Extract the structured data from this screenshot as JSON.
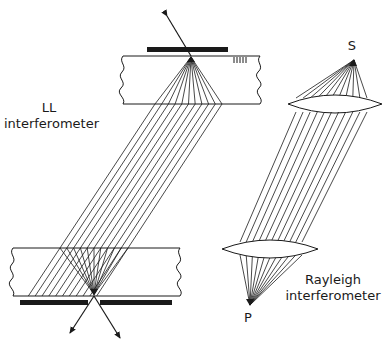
{
  "diagram": {
    "labels": {
      "ll_title_line1": "LL",
      "ll_title_line2": "interferometer",
      "rayleigh_line1": "Rayleigh",
      "rayleigh_line2": "interferometer",
      "source": "S",
      "point": "P"
    },
    "colors": {
      "ink": "#1a1a1a",
      "background": "#ffffff"
    },
    "ll_interferometer": {
      "top_slab": {
        "x1": 123,
        "x2": 260,
        "y_top": 56,
        "y_bottom": 104
      },
      "top_bar": {
        "x1": 147,
        "x2": 228,
        "y1": 47,
        "y2": 52
      },
      "top_focus": [
        191,
        57
      ],
      "incoming_arrow": {
        "from": [
          167,
          16
        ],
        "to": [
          191,
          56
        ]
      },
      "top_fan_bottom_x": [
        155,
        222
      ],
      "bottom_slab": {
        "x1": 13,
        "x2": 180,
        "y_top": 248,
        "y_bottom": 296
      },
      "bottom_bar": {
        "x1": 20,
        "x2": 172,
        "gap": [
          88,
          100
        ],
        "y1": 300,
        "y2": 305
      },
      "bottom_focus": [
        94,
        294
      ],
      "bottom_entry_x": [
        60,
        128
      ],
      "outgoing_arrows": [
        {
          "from": [
            94,
            294
          ],
          "to": [
            70,
            333
          ]
        },
        {
          "from": [
            94,
            294
          ],
          "to": [
            120,
            338
          ]
        }
      ],
      "ray_count": 11
    },
    "rayleigh_interferometer": {
      "source_point": [
        354,
        60
      ],
      "upper_lens": {
        "x1": 288,
        "x2": 382,
        "cy": 104,
        "half_thickness": 9
      },
      "upper_exit_x": [
        296,
        367
      ],
      "lower_lens": {
        "x1": 222,
        "x2": 318,
        "cy": 249,
        "half_thickness": 9
      },
      "lower_entry_x": [
        240,
        302
      ],
      "focus_point": [
        250,
        305
      ],
      "ray_count": 11
    }
  }
}
